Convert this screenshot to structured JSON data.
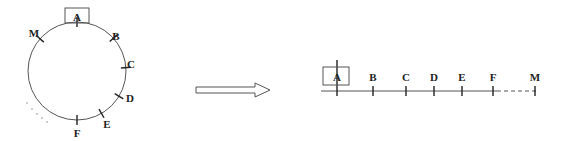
{
  "diagram": {
    "colors": {
      "stroke": "#555555",
      "tick": "#222222",
      "text": "#222222"
    },
    "circle": {
      "cx": 77,
      "cy": 71,
      "r": 49,
      "highlighted_label": "A",
      "points": [
        {
          "label": "A",
          "angle": -90,
          "lx": 77,
          "ly": 17
        },
        {
          "label": "B",
          "angle": -42,
          "lx": 116,
          "ly": 36
        },
        {
          "label": "C",
          "angle": -4,
          "lx": 131,
          "ly": 64
        },
        {
          "label": "D",
          "angle": 31,
          "lx": 130,
          "ly": 98
        },
        {
          "label": "E",
          "angle": 60,
          "lx": 107,
          "ly": 124
        },
        {
          "label": "F",
          "angle": 90,
          "lx": 77,
          "ly": 133
        },
        {
          "label": "M",
          "angle": -139,
          "lx": 34,
          "ly": 33
        }
      ],
      "ellipsis_dots": [
        [
          27,
          103
        ],
        [
          32,
          109
        ],
        [
          37,
          114
        ],
        [
          42,
          118
        ],
        [
          47,
          122
        ]
      ]
    },
    "arrow": {
      "x1": 196,
      "x2": 270,
      "y": 90,
      "label": ""
    },
    "line": {
      "y": 91,
      "x_start": 321,
      "solid_end": 497,
      "x_end": 538,
      "highlighted_label": "A",
      "points": [
        {
          "label": "A",
          "x": 337
        },
        {
          "label": "B",
          "x": 373
        },
        {
          "label": "C",
          "x": 406
        },
        {
          "label": "D",
          "x": 434
        },
        {
          "label": "E",
          "x": 462
        },
        {
          "label": "F",
          "x": 493
        },
        {
          "label": "M",
          "x": 535
        }
      ]
    }
  }
}
